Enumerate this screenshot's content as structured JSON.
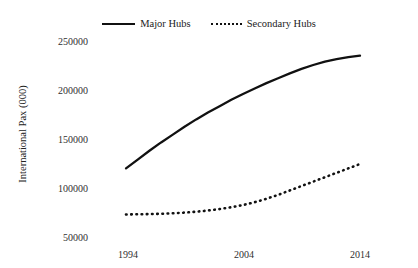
{
  "legend": {
    "position": "top-center",
    "entries": [
      {
        "label": "Major Hubs",
        "style": "solid",
        "icon": "solid-line-icon"
      },
      {
        "label": "Secondary Hubs",
        "style": "dotted",
        "icon": "dotted-line-icon"
      }
    ]
  },
  "axes": {
    "ylabel": "International Pax (000)",
    "xlabel": "",
    "yticks": [
      "50000",
      "100000",
      "150000",
      "200000",
      "250000"
    ],
    "xticks": [
      "1994",
      "2004",
      "2014"
    ]
  },
  "chart_data": {
    "type": "line",
    "title": "",
    "xlabel": "",
    "ylabel": "International Pax (000)",
    "xlim": [
      1994,
      2014
    ],
    "ylim": [
      50000,
      250000
    ],
    "ytick_values": [
      50000,
      100000,
      150000,
      200000,
      250000
    ],
    "xtick_values": [
      1994,
      2004,
      2014
    ],
    "grid": false,
    "legend_position": "top-center",
    "x": [
      1994,
      1995,
      1996,
      1997,
      1998,
      1999,
      2000,
      2001,
      2002,
      2003,
      2004,
      2005,
      2006,
      2007,
      2008,
      2009,
      2010,
      2011,
      2012,
      2013,
      2014
    ],
    "series": [
      {
        "name": "Major Hubs",
        "style": "solid",
        "color": "#111111",
        "values": [
          120000,
          129000,
          138000,
          146500,
          154500,
          162500,
          170000,
          177000,
          183500,
          190000,
          196000,
          201500,
          207000,
          212000,
          217000,
          221500,
          225500,
          229000,
          231500,
          233500,
          235000
        ]
      },
      {
        "name": "Secondary Hubs",
        "style": "dotted",
        "color": "#111111",
        "values": [
          73000,
          73200,
          73400,
          73700,
          74200,
          74900,
          75800,
          77000,
          78500,
          80400,
          82600,
          85500,
          89000,
          93000,
          97500,
          102000,
          106500,
          111000,
          115500,
          120000,
          124500
        ]
      }
    ]
  }
}
